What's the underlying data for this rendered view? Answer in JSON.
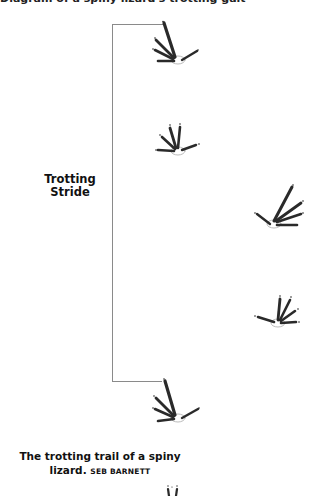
{
  "figure": {
    "top_text_cropped": "Diagram of a spiny lizard's trotting gait",
    "stride_label_line1": "Trotting",
    "stride_label_line2": "Stride",
    "caption": "The trotting trail of a spiny lizard.",
    "credit": "SEB BARNETT",
    "line_color": "#8a8a8a",
    "ink_color": "#2a2a2a",
    "footprints": [
      {
        "id": "print-1",
        "x": 150,
        "y": 20,
        "w": 50,
        "h": 50,
        "orientation": "front-right-up"
      },
      {
        "id": "print-2",
        "x": 148,
        "y": 120,
        "w": 56,
        "h": 40,
        "orientation": "front-small"
      },
      {
        "id": "print-3",
        "x": 252,
        "y": 184,
        "w": 60,
        "h": 50,
        "orientation": "right-up"
      },
      {
        "id": "print-4",
        "x": 250,
        "y": 292,
        "w": 56,
        "h": 40,
        "orientation": "right-small"
      },
      {
        "id": "print-5",
        "x": 150,
        "y": 376,
        "w": 55,
        "h": 50,
        "orientation": "front-right-up"
      },
      {
        "id": "print-6",
        "x": 162,
        "y": 484,
        "w": 22,
        "h": 12,
        "orientation": "partial"
      }
    ]
  }
}
